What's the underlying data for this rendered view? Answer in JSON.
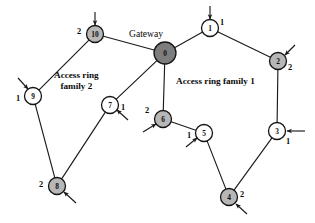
{
  "figure": {
    "width": 315,
    "height": 223,
    "background": "#ffffff"
  },
  "colors": {
    "stroke": "#1b1b1b",
    "node_white": "#ffffff",
    "node_gray": "#b7b7b7",
    "node_gateway": "#7d7d7d",
    "text": "#0b0b0b"
  },
  "annotations": {
    "gateway_label": "Gateway",
    "region_family_1": "Access ring family 1",
    "region_family_2": "Access ring\nfamily 2"
  },
  "nodes": [
    {
      "id": "0",
      "label": "0",
      "x": 165,
      "y": 53,
      "r": 11,
      "fill": "darkgray",
      "degree": "",
      "deg_x": 0,
      "deg_y": 0
    },
    {
      "id": "1",
      "label": "1",
      "x": 210,
      "y": 28,
      "r": 8.5,
      "fill": "white",
      "degree": "1",
      "deg_x": 222,
      "deg_y": 22
    },
    {
      "id": "2",
      "label": "2",
      "x": 278,
      "y": 61,
      "r": 8.5,
      "fill": "gray",
      "degree": "2",
      "deg_x": 290,
      "deg_y": 67
    },
    {
      "id": "3",
      "label": "3",
      "x": 277,
      "y": 131,
      "r": 8.5,
      "fill": "white",
      "degree": "1",
      "deg_x": 288,
      "deg_y": 141
    },
    {
      "id": "4",
      "label": "4",
      "x": 229,
      "y": 197,
      "r": 8.5,
      "fill": "gray",
      "degree": "2",
      "deg_x": 242,
      "deg_y": 194
    },
    {
      "id": "5",
      "label": "5",
      "x": 204,
      "y": 133,
      "r": 8.5,
      "fill": "white",
      "degree": "1",
      "deg_x": 189,
      "deg_y": 135
    },
    {
      "id": "6",
      "label": "6",
      "x": 163,
      "y": 119,
      "r": 8.5,
      "fill": "gray",
      "degree": "2",
      "deg_x": 147,
      "deg_y": 110
    },
    {
      "id": "7",
      "label": "7",
      "x": 110,
      "y": 105,
      "r": 8.5,
      "fill": "white",
      "degree": "1",
      "deg_x": 123,
      "deg_y": 107
    },
    {
      "id": "8",
      "label": "8",
      "x": 57,
      "y": 186,
      "r": 8.5,
      "fill": "gray",
      "degree": "2",
      "deg_x": 41,
      "deg_y": 184
    },
    {
      "id": "9",
      "label": "9",
      "x": 33,
      "y": 96,
      "r": 8.5,
      "fill": "white",
      "degree": "1",
      "deg_x": 18,
      "deg_y": 98
    },
    {
      "id": "10",
      "label": "10",
      "x": 95,
      "y": 34,
      "r": 8.5,
      "fill": "gray",
      "degree": "2",
      "deg_x": 79,
      "deg_y": 31
    }
  ],
  "edges": [
    {
      "from": "0",
      "to": "1",
      "ring": "family-1"
    },
    {
      "from": "1",
      "to": "2",
      "ring": "family-1"
    },
    {
      "from": "2",
      "to": "3",
      "ring": "family-1"
    },
    {
      "from": "3",
      "to": "4",
      "ring": "family-1"
    },
    {
      "from": "4",
      "to": "5",
      "ring": "family-1"
    },
    {
      "from": "5",
      "to": "6",
      "ring": "family-1"
    },
    {
      "from": "6",
      "to": "0",
      "ring": "family-1"
    },
    {
      "from": "0",
      "to": "10",
      "ring": "family-2"
    },
    {
      "from": "10",
      "to": "9",
      "ring": "family-2"
    },
    {
      "from": "9",
      "to": "8",
      "ring": "family-2"
    },
    {
      "from": "8",
      "to": "7",
      "ring": "family-2"
    },
    {
      "from": "7",
      "to": "0",
      "ring": "family-2"
    }
  ],
  "access_stubs": [
    {
      "node": "1",
      "x1": 210,
      "y1": 6,
      "x2": 210,
      "y2": 19,
      "arrow": true
    },
    {
      "node": "2",
      "x1": 295,
      "y1": 45,
      "x2": 285,
      "y2": 55,
      "arrow": true
    },
    {
      "node": "3",
      "x1": 305,
      "y1": 131,
      "x2": 287,
      "y2": 131,
      "arrow": true
    },
    {
      "node": "4",
      "x1": 247,
      "y1": 214,
      "x2": 236,
      "y2": 204,
      "arrow": true
    },
    {
      "node": "5",
      "x1": 186,
      "y1": 147,
      "x2": 197,
      "y2": 138,
      "arrow": true
    },
    {
      "node": "6",
      "x1": 143,
      "y1": 132,
      "x2": 156,
      "y2": 124,
      "arrow": true
    },
    {
      "node": "7",
      "x1": 128,
      "y1": 120,
      "x2": 117,
      "y2": 110,
      "arrow": true
    },
    {
      "node": "8",
      "x1": 76,
      "y1": 203,
      "x2": 64,
      "y2": 192,
      "arrow": true
    },
    {
      "node": "9",
      "x1": 18,
      "y1": 78,
      "x2": 28,
      "y2": 89,
      "arrow": true
    },
    {
      "node": "10",
      "x1": 95,
      "y1": 12,
      "x2": 95,
      "y2": 25,
      "arrow": true
    }
  ],
  "label_positions": {
    "gateway": {
      "x": 129,
      "y": 28
    },
    "family_1": {
      "x": 176,
      "y": 76
    },
    "family_2": {
      "x": 54,
      "y": 70
    }
  }
}
